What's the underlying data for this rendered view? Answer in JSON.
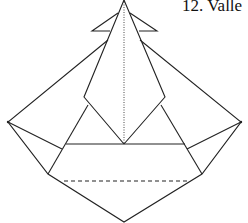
{
  "caption": "12. Valle",
  "colors": {
    "line": "#222222",
    "background": "#ffffff"
  }
}
